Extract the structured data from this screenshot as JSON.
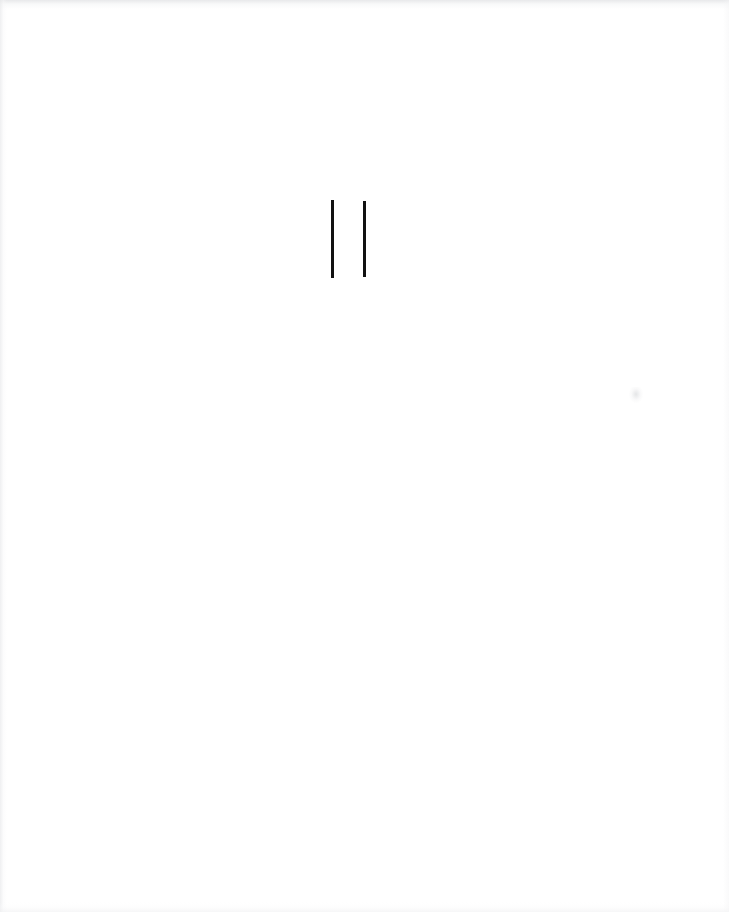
{
  "page": {
    "width": 729,
    "height": 912,
    "background_color": "#ffffff",
    "medium": "scanned paper page",
    "visible_text": ""
  },
  "marks": {
    "group_label": "double vertical stroke mark",
    "ink_color": "#111111",
    "count": 2,
    "items": [
      {
        "label": "left vertical stroke",
        "x": 331,
        "y": 200,
        "width": 3,
        "height": 78
      },
      {
        "label": "right vertical stroke",
        "x": 363,
        "y": 201,
        "width": 3,
        "height": 76
      }
    ]
  },
  "artifacts": {
    "label": "scanner edge and dust artifacts",
    "edge_tint": "#e8e9eb",
    "specks": [
      {
        "label": "faint dust speck",
        "x": 629,
        "y": 387
      }
    ]
  }
}
